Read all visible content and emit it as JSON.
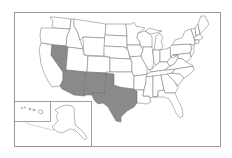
{
  "map": {
    "title": "United States map with highlighted states",
    "highlight_color": "#8a8a8a",
    "base_color": "#ffffff",
    "border_color": "#6f6f6f",
    "frame_color": "#9a9a9a",
    "highlighted_states": [
      "Nevada",
      "Arizona",
      "New Mexico",
      "Texas"
    ],
    "insets": [
      "Alaska",
      "Hawaii"
    ]
  }
}
